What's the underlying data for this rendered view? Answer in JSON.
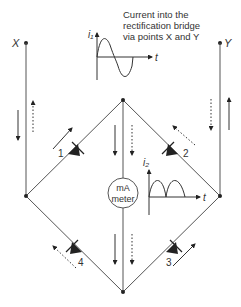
{
  "caption": {
    "line1": "Current into the",
    "line2": "rectification bridge",
    "line3": "via points X and Y"
  },
  "terminals": {
    "left": "X",
    "right": "Y"
  },
  "meter": {
    "line1": "mA",
    "line2": "meter"
  },
  "diodes": [
    {
      "id": "1",
      "label": "1"
    },
    {
      "id": "2",
      "label": "2"
    },
    {
      "id": "3",
      "label": "3"
    },
    {
      "id": "4",
      "label": "4"
    }
  ],
  "graphs": {
    "input": {
      "ylabel": "i₁",
      "xlabel": "t",
      "waveform": "sine (full AC cycle)"
    },
    "output": {
      "ylabel": "i₂",
      "xlabel": "t",
      "waveform": "full-wave rectified"
    }
  },
  "legend_semantics": {
    "solid_arrows": "current path during one half-cycle",
    "dotted_arrows": "current path during the other half-cycle"
  },
  "colors": {
    "line": "#444444",
    "arrow": "#222222",
    "background": "#ffffff"
  }
}
